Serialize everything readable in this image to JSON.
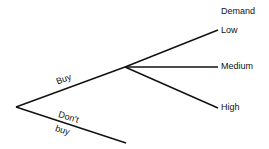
{
  "diagram": {
    "type": "decision-tree",
    "header": "Demand",
    "decision_branches": [
      {
        "label": "Buy"
      },
      {
        "label_line1": "Don't",
        "label_line2": "buy"
      }
    ],
    "outcomes": [
      {
        "label": "Low"
      },
      {
        "label": "Medium"
      },
      {
        "label": "High"
      }
    ],
    "line_color": "#111111"
  }
}
